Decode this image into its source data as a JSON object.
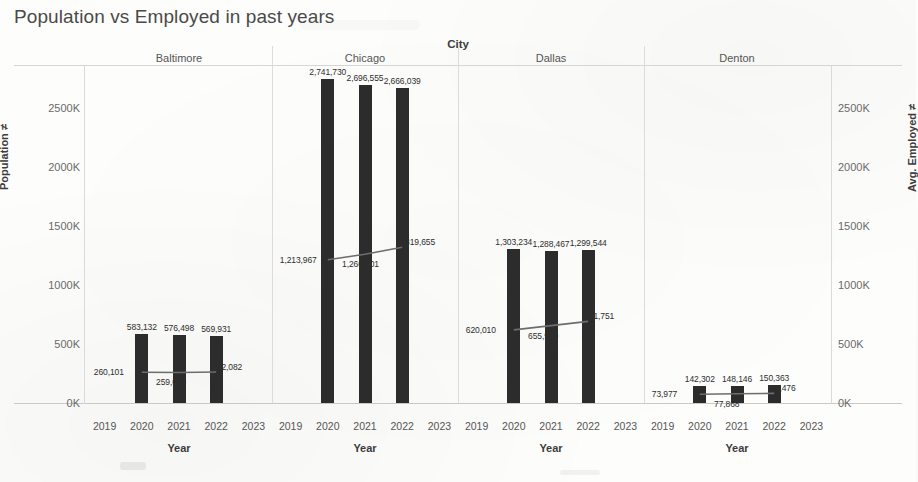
{
  "title": "Population vs Employed  in past years",
  "axes": {
    "column_title": "City",
    "left_axis_title": "Population ≠",
    "right_axis_title": "Avg. Employed ≠",
    "x_axis_title": "Year",
    "y_ticks": [
      "0K",
      "500K",
      "1000K",
      "1500K",
      "2000K",
      "2500K"
    ],
    "y_tick_values": [
      0,
      500000,
      1000000,
      1500000,
      2000000,
      2500000
    ],
    "x_ticks": [
      "2019",
      "2020",
      "2021",
      "2022",
      "2023"
    ]
  },
  "chart_data": {
    "type": "bar",
    "title": "Population vs Employed  in past years",
    "xlabel": "Year",
    "ylabel": "Population ≠",
    "y2label": "Avg. Employed ≠",
    "grid": false,
    "legend": "none",
    "ylim": [
      0,
      2800000
    ],
    "categories": [
      "2019",
      "2020",
      "2021",
      "2022",
      "2023"
    ],
    "facet_label": "City",
    "facets": [
      {
        "name": "Baltimore",
        "x": [
          "2020",
          "2021",
          "2022"
        ],
        "series": [
          {
            "name": "Population",
            "mark": "bar",
            "axis": "left",
            "values": [
              583132,
              576498,
              569931
            ],
            "labels": [
              "583,132",
              "576,498",
              "569,931"
            ]
          },
          {
            "name": "Avg. Employed",
            "mark": "line",
            "axis": "right",
            "values": [
              260101,
              259039,
              262082
            ],
            "labels": [
              "260,101",
              "259,039",
              "262,082"
            ]
          }
        ]
      },
      {
        "name": "Chicago",
        "x": [
          "2020",
          "2021",
          "2022"
        ],
        "series": [
          {
            "name": "Population",
            "mark": "bar",
            "axis": "left",
            "values": [
              2741730,
              2696555,
              2666039
            ],
            "labels": [
              "2,741,730",
              "2,696,555",
              "2,666,039"
            ]
          },
          {
            "name": "Avg. Employed",
            "mark": "line",
            "axis": "right",
            "values": [
              1213967,
              1260301,
              1319655
            ],
            "labels": [
              "1,213,967",
              "1,260,301",
              "1,319,655"
            ]
          }
        ]
      },
      {
        "name": "Dallas",
        "x": [
          "2020",
          "2021",
          "2022"
        ],
        "series": [
          {
            "name": "Population",
            "mark": "bar",
            "axis": "left",
            "values": [
              1303234,
              1288467,
              1299544
            ],
            "labels": [
              "1,303,234",
              "1,288,467",
              "1,299,544"
            ]
          },
          {
            "name": "Avg. Employed",
            "mark": "line",
            "axis": "right",
            "values": [
              620010,
              655900,
              691751
            ],
            "labels": [
              "620,010",
              "655,900",
              "691,751"
            ]
          }
        ]
      },
      {
        "name": "Denton",
        "x": [
          "2020",
          "2021",
          "2022"
        ],
        "series": [
          {
            "name": "Population",
            "mark": "bar",
            "axis": "left",
            "values": [
              142302,
              148146,
              150363
            ],
            "labels": [
              "142,302",
              "148,146",
              "150,363"
            ]
          },
          {
            "name": "Avg. Employed",
            "mark": "line",
            "axis": "right",
            "values": [
              73977,
              77868,
              81476
            ],
            "labels": [
              "73,977",
              "77,868",
              "81,476"
            ]
          }
        ]
      }
    ]
  },
  "colors": {
    "bar": "#2c2c2c",
    "line": "#6d6d6d",
    "text": "#3b3b3b",
    "axis": "#dadad6",
    "background": "#fdfdfb"
  }
}
